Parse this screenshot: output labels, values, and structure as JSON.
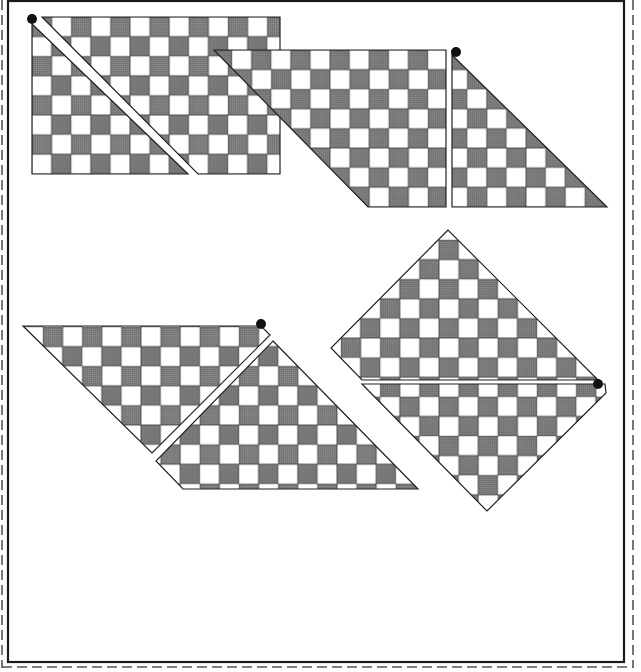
{
  "canvas": {
    "width": 641,
    "height": 672,
    "background": "#ffffff"
  },
  "colors": {
    "dark_cell": "#6e6e6e",
    "light_cell": "#ffffff",
    "outline": "#222222",
    "dot": "#111111",
    "frame": "#1a1a1a",
    "dashed": "#555555"
  },
  "frame": {
    "x": 8,
    "y": 1,
    "width": 616,
    "height": 661,
    "stroke_width": 2.2
  },
  "cut_guides": [
    {
      "points": [
        [
          2,
          0
        ],
        [
          2,
          668
        ]
      ]
    },
    {
      "points": [
        [
          633,
          0
        ],
        [
          633,
          668
        ]
      ]
    },
    {
      "points": [
        [
          2,
          667
        ],
        [
          633,
          667
        ]
      ]
    }
  ],
  "cell_size": 19.6,
  "figures": [
    {
      "id": "figure-rectangle-split",
      "grid": {
        "origin": [
          32,
          17
        ],
        "phase": 0
      },
      "pieces": [
        {
          "name": "piece-triangle-left",
          "points": [
            [
              32,
              24
            ],
            [
              32,
              174
            ],
            [
              188,
              174
            ]
          ]
        },
        {
          "name": "piece-upper-right",
          "points": [
            [
              42,
              17
            ],
            [
              280,
              17
            ],
            [
              280,
              174
            ],
            [
              198,
              174
            ]
          ]
        }
      ],
      "dot": [
        32,
        19
      ]
    },
    {
      "id": "figure-parallelogram-triangle",
      "grid": {
        "origin": [
          232,
          50
        ],
        "phase": 1
      },
      "pieces": [
        {
          "name": "piece-parallelogram",
          "points": [
            [
              214,
              50
            ],
            [
              446,
              50
            ],
            [
              446,
              207
            ],
            [
              368,
              207
            ]
          ]
        },
        {
          "name": "piece-triangle-right",
          "points": [
            [
              452,
              55
            ],
            [
              452,
              207
            ],
            [
              607,
              207
            ]
          ]
        }
      ],
      "dot": [
        456,
        52
      ]
    },
    {
      "id": "figure-lower-left",
      "grid": {
        "origin": [
          43,
          327
        ],
        "phase": 0
      },
      "pieces": [
        {
          "name": "piece-top-parallelogram",
          "points": [
            [
              23,
              326
            ],
            [
              261,
              326
            ],
            [
              270,
              335
            ],
            [
              152,
              453
            ]
          ]
        },
        {
          "name": "piece-bottom-trapezoid",
          "points": [
            [
              273,
              341
            ],
            [
              418,
              489
            ],
            [
              183,
              489
            ],
            [
              156,
              461
            ]
          ]
        }
      ],
      "dot": [
        261,
        324
      ]
    },
    {
      "id": "figure-diamond",
      "grid": {
        "origin": [
          341,
          240
        ],
        "phase": 1
      },
      "pieces": [
        {
          "name": "piece-diamond-top",
          "points": [
            [
              448,
              230
            ],
            [
              331,
              348
            ],
            [
              362,
              380
            ],
            [
              598,
              380
            ]
          ]
        },
        {
          "name": "piece-diamond-bottom",
          "points": [
            [
              362,
              384
            ],
            [
              605,
              384
            ],
            [
              606,
              393
            ],
            [
              487,
              511
            ]
          ]
        }
      ],
      "dot": [
        598,
        384
      ]
    }
  ]
}
